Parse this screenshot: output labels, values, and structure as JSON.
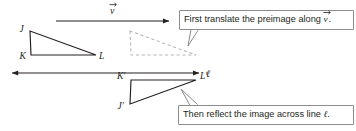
{
  "figure": {
    "background": "#ffffff",
    "stroke_color": "#231f20",
    "dashed_color": "#b8b8bc",
    "callout_border": "#8c8c8c"
  },
  "preimage": {
    "name": "triangle-JKL",
    "vertices": [
      {
        "label": "J",
        "x": 30,
        "y": 31
      },
      {
        "label": "K",
        "x": 31,
        "y": 55
      },
      {
        "label": "L",
        "x": 96,
        "y": 55
      }
    ],
    "label_J": "J",
    "label_K": "K",
    "label_L": "L"
  },
  "translated_image": {
    "name": "dashed-translated-triangle",
    "style": "dashed",
    "vertices": [
      {
        "x": 130,
        "y": 31
      },
      {
        "x": 131,
        "y": 55
      },
      {
        "x": 196,
        "y": 55
      }
    ]
  },
  "final_image": {
    "name": "triangle-J-prime-K-prime-L-prime",
    "vertices": [
      {
        "label": "K'",
        "x": 131,
        "y": 80
      },
      {
        "label": "L'",
        "x": 196,
        "y": 80
      },
      {
        "label": "J'",
        "x": 130,
        "y": 104
      }
    ],
    "label_Jp": "J′",
    "label_Kp": "K′",
    "label_Lp": "L′"
  },
  "vector": {
    "name": "translation-vector",
    "label": "v",
    "has_arrow_accent": true,
    "arrow_from_x": 56,
    "arrow_to_x": 173,
    "arrow_y": 21
  },
  "line_ell": {
    "name": "line-of-reflection",
    "label": "ℓ",
    "from_x": 8,
    "to_x": 203,
    "y": 73,
    "double_headed": true,
    "label_x": 208,
    "label_y": 77
  },
  "callouts": [
    {
      "name": "callout-translate",
      "text_before": "First translate the preimage along ",
      "text_italic": "v",
      "text_after": ".",
      "full_text": "First translate the preimage along v⃗.",
      "x": 179,
      "y": 10,
      "width": 175,
      "height": 20,
      "tail_points": "190,30 188,45 197,30"
    },
    {
      "name": "callout-reflect",
      "text_before": "Then reflect the image across line ",
      "text_italic": "ℓ",
      "text_after": ".",
      "full_text": "Then reflect the image across line ℓ.",
      "x": 178,
      "y": 105,
      "width": 176,
      "height": 20,
      "tail_points": "190,105 181,90 199,105"
    }
  ]
}
